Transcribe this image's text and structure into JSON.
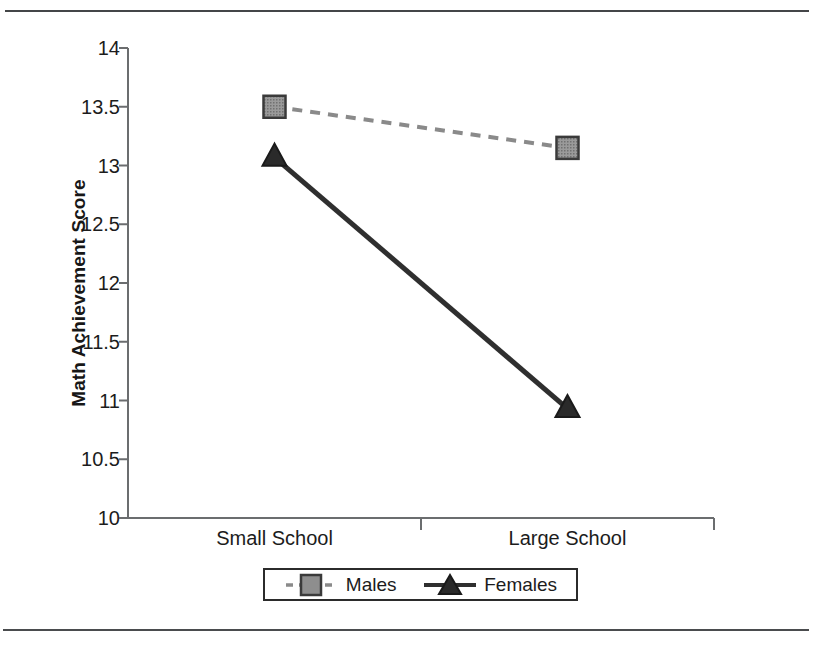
{
  "figure": {
    "background": "#ffffff",
    "rules": {
      "top": true,
      "bottom": true,
      "color": "#46484a"
    }
  },
  "chart_data": {
    "type": "line",
    "title": "",
    "xlabel": "",
    "ylabel": "Math Achievement Score",
    "categories": [
      "Small School",
      "Large School"
    ],
    "ylim": [
      10,
      14
    ],
    "ytick_labels": [
      "10",
      "10.5",
      "11",
      "11.5",
      "12",
      "12.5",
      "13",
      "13.5",
      "14"
    ],
    "ytick_values": [
      10,
      10.5,
      11,
      11.5,
      12,
      12.5,
      13,
      13.5,
      14
    ],
    "grid": false,
    "legend_position": "bottom",
    "series": [
      {
        "name": "Males",
        "values": [
          13.5,
          13.15
        ],
        "marker": "square",
        "marker_fill": "#8e8e8e",
        "marker_edge": "#3a3a3a",
        "line_style": "dashed",
        "line_color": "#8a8a8a"
      },
      {
        "name": "Females",
        "values": [
          13.07,
          10.93
        ],
        "marker": "triangle",
        "marker_fill": "#2a2a2a",
        "marker_edge": "#1a1a1a",
        "line_style": "solid",
        "line_color": "#2f2f2f"
      }
    ]
  },
  "axes": {
    "axis_color": "#6b6d6f",
    "tick_color": "#6b6d6f"
  }
}
